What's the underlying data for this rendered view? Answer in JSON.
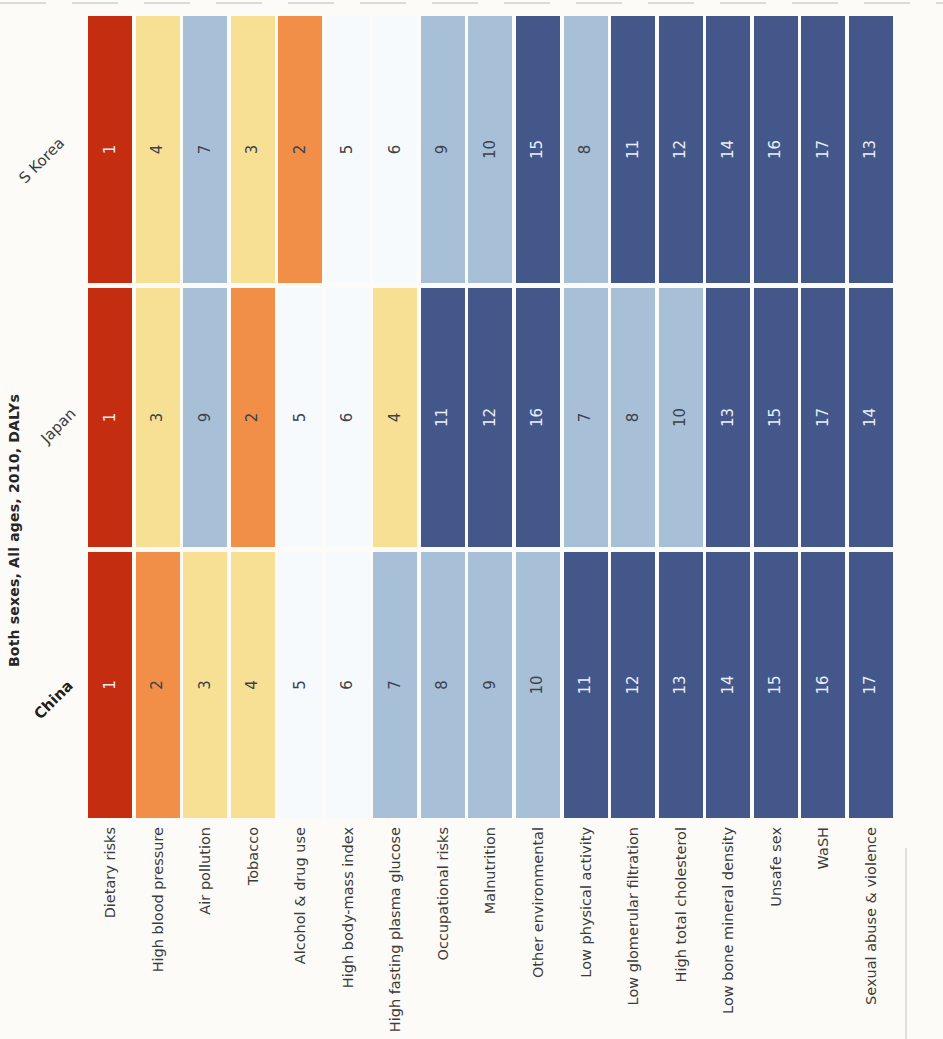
{
  "chart_data": {
    "type": "heatmap",
    "title": "Both sexes, All ages, 2010, DALYs",
    "unit": "rank",
    "rows": [
      "Dietary risks",
      "High blood pressure",
      "Air pollution",
      "Tobacco",
      "Alcohol & drug use",
      "High body-mass index",
      "High fasting plasma glucose",
      "Occupational risks",
      "Malnutrition",
      "Other environmental",
      "Low physical activity",
      "Low glomerular filtration",
      "High total cholesterol",
      "Low bone mineral density",
      "Unsafe sex",
      "WaSH",
      "Sexual abuse & violence"
    ],
    "columns": [
      {
        "label": "China",
        "bold": true
      },
      {
        "label": "Japan",
        "bold": false
      },
      {
        "label": "S Korea",
        "bold": false
      }
    ],
    "series": [
      {
        "name": "China",
        "values": [
          1,
          2,
          3,
          4,
          5,
          6,
          7,
          8,
          9,
          10,
          11,
          12,
          13,
          14,
          15,
          16,
          17
        ]
      },
      {
        "name": "Japan",
        "values": [
          1,
          3,
          9,
          2,
          5,
          6,
          4,
          11,
          12,
          16,
          7,
          8,
          10,
          13,
          15,
          17,
          14
        ]
      },
      {
        "name": "S Korea",
        "values": [
          1,
          4,
          7,
          3,
          2,
          5,
          6,
          9,
          10,
          15,
          8,
          11,
          12,
          14,
          16,
          17,
          13
        ]
      }
    ],
    "rank_colors": {
      "1": "#c52d10",
      "2": "#f18e47",
      "3": "#f7e093",
      "4": "#f7e093",
      "5": "#f6fafc",
      "6": "#f6fafc",
      "7": "#a7c0d8",
      "8": "#a7c0d8",
      "9": "#a7c0d8",
      "10": "#a7c0d8",
      "11": "#43578b",
      "12": "#43578b",
      "13": "#43578b",
      "14": "#43578b",
      "15": "#43578b",
      "16": "#43578b",
      "17": "#43578b"
    },
    "light_text_ranks": [
      1,
      11,
      12,
      13,
      14,
      15,
      16,
      17
    ],
    "number_text_light": "#e9eef6",
    "number_text_dark": "#3d424b",
    "layout_note": "rotated 90deg CCW photo of ranking heatmap"
  }
}
